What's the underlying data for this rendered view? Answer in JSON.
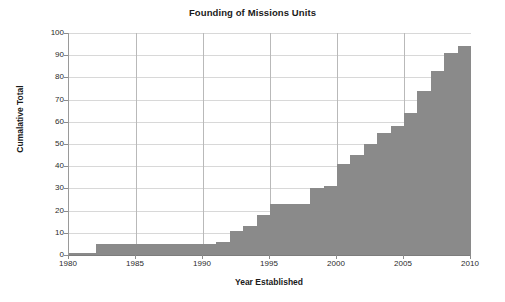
{
  "chart_data": {
    "type": "area",
    "title": "Founding of Missions Units",
    "xlabel": "Year Established",
    "ylabel": "Cumalative Total",
    "grid": true,
    "legend": "none",
    "xlim": [
      1980,
      2010
    ],
    "ylim": [
      0,
      100
    ],
    "x_tick_labels": [
      "1980",
      "1985",
      "1990",
      "1995",
      "2000",
      "2005",
      "2010"
    ],
    "x_ticks": [
      1980,
      1985,
      1990,
      1995,
      2000,
      2005,
      2010
    ],
    "y_tick_labels": [
      "0",
      "10",
      "20",
      "30",
      "40",
      "50",
      "60",
      "70",
      "80",
      "90",
      "100"
    ],
    "y_ticks": [
      0,
      10,
      20,
      30,
      40,
      50,
      60,
      70,
      80,
      90,
      100
    ],
    "x": [
      1980,
      1981,
      1982,
      1983,
      1984,
      1985,
      1986,
      1987,
      1988,
      1989,
      1990,
      1991,
      1992,
      1993,
      1994,
      1995,
      1996,
      1997,
      1998,
      1999,
      2000,
      2001,
      2002,
      2003,
      2004,
      2005,
      2006,
      2007,
      2008,
      2009
    ],
    "values": [
      1,
      1,
      5,
      5,
      5,
      5,
      5,
      5,
      5,
      5,
      5,
      6,
      11,
      13,
      18,
      23,
      23,
      23,
      30,
      31,
      41,
      45,
      50,
      55,
      58,
      64,
      74,
      83,
      91,
      94
    ],
    "series": [
      {
        "name": "Cumulative founded units",
        "values": [
          1,
          1,
          5,
          5,
          5,
          5,
          5,
          5,
          5,
          5,
          5,
          6,
          11,
          13,
          18,
          23,
          23,
          23,
          30,
          31,
          41,
          45,
          50,
          55,
          58,
          64,
          74,
          83,
          91,
          94
        ]
      }
    ],
    "colors": {
      "series_fill": "#8a8a8a",
      "gridline": "#d8d8d8",
      "major_gridline": "#b9b9b9",
      "axis": "#7d7d7d",
      "text": "#1a1a1a",
      "background": "#ffffff"
    }
  }
}
